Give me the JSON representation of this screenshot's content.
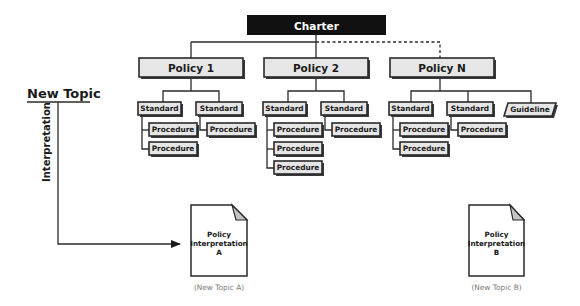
{
  "diagram": {
    "charter": {
      "label": "Charter"
    },
    "policies": [
      {
        "label": "Policy 1",
        "children": [
          {
            "type": "Standard",
            "label": "Standard",
            "procedures": [
              "Procedure",
              "Procedure"
            ]
          },
          {
            "type": "Standard",
            "label": "Standard",
            "procedures": [
              "Procedure"
            ]
          }
        ]
      },
      {
        "label": "Policy 2",
        "children": [
          {
            "type": "Standard",
            "label": "Standard",
            "procedures": [
              "Procedure",
              "Procedure",
              "Procedure"
            ]
          },
          {
            "type": "Standard",
            "label": "Standard",
            "procedures": [
              "Procedure"
            ]
          }
        ]
      },
      {
        "label": "Policy N",
        "connector": "dashed",
        "children": [
          {
            "type": "Standard",
            "label": "Standard",
            "procedures": [
              "Procedure",
              "Procedure"
            ]
          },
          {
            "type": "Standard",
            "label": "Standard",
            "procedures": [
              "Procedure"
            ]
          },
          {
            "type": "Guideline",
            "label": "Guideline",
            "procedures": []
          }
        ]
      }
    ],
    "new_topic": {
      "label": "New Topic",
      "arrow_label": "Interpretation"
    },
    "documents": [
      {
        "line1": "Policy",
        "line2": "Interpretation",
        "line3": "A",
        "caption": "(New Topic A)"
      },
      {
        "line1": "Policy",
        "line2": "Interpretation",
        "line3": "B",
        "caption": "(New Topic B)"
      }
    ],
    "colors": {
      "charter_fill": "#111111",
      "box_fill": "#e6e6e6",
      "stroke": "#2a2a2a",
      "fold_fill": "#c4c4c4",
      "caption_text": "#7a7a7a"
    }
  }
}
